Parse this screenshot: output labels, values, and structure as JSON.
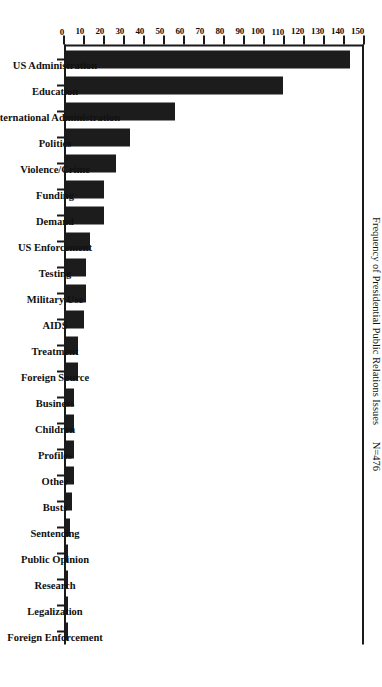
{
  "chart_data": {
    "type": "bar",
    "title": "",
    "subtitle": "",
    "xlabel": "",
    "ylabel": "Frequency of Presidential Public Relations Issues",
    "annotation": "N=476",
    "orientation": "vertical-bars-page-rotated-90",
    "grid": false,
    "legend": false,
    "ylim": [
      0,
      150
    ],
    "ytick_step": 10,
    "ytick_labels": [
      "0",
      "10",
      "20",
      "30",
      "40",
      "50",
      "60",
      "70",
      "80",
      "90",
      "100",
      "110",
      "120",
      "130",
      "140",
      "150"
    ],
    "ytick_values": [
      0,
      10,
      20,
      30,
      40,
      50,
      60,
      70,
      80,
      90,
      100,
      110,
      120,
      130,
      140,
      150
    ],
    "bar_color": "#1c1c1c",
    "axis_color": "#1a1a1a",
    "background_color": "#ffffff",
    "categories": [
      "US Administration",
      "Education",
      "International Administration",
      "Politics",
      "Violence/Crime",
      "Funding",
      "Demand",
      "US Enforcement",
      "Testing",
      "Military Use",
      "AIDS",
      "Treatment",
      "Foreign Source",
      "Business",
      "Children",
      "Profiles",
      "Other",
      "Busts",
      "Sentencing",
      "Public Opinion",
      "Research",
      "Legalization",
      "Foreign Enforcement"
    ],
    "values": [
      143,
      109,
      55,
      32,
      25,
      19,
      19,
      12,
      10,
      10,
      9,
      6,
      6,
      4,
      4,
      4,
      4,
      3,
      2,
      1,
      1,
      1,
      1
    ]
  }
}
